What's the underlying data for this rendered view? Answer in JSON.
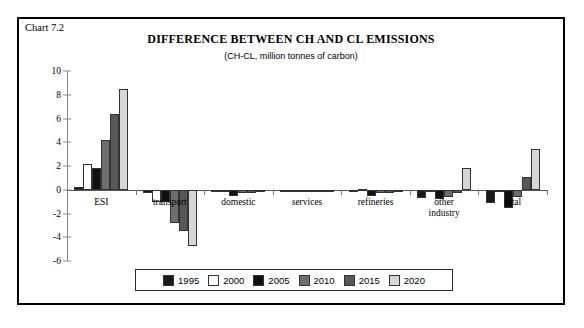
{
  "chart_label": "Chart 7.2",
  "chart_data": {
    "type": "bar",
    "title": "DIFFERENCE BETWEEN CH AND CL EMISSIONS",
    "subtitle": "(CH-CL, million tonnes of carbon)",
    "xlabel": "",
    "ylabel": "",
    "ylim": [
      -6,
      10
    ],
    "yticks": [
      10,
      8,
      6,
      4,
      2,
      0,
      -2,
      -4,
      -6
    ],
    "grid": false,
    "legend_position": "bottom",
    "categories": [
      "ESI",
      "transport",
      "domestic",
      "services",
      "refineries",
      "other industry",
      "total"
    ],
    "category_lines": [
      [
        "ESI"
      ],
      [
        "transport"
      ],
      [
        "domestic"
      ],
      [
        "services"
      ],
      [
        "refineries"
      ],
      [
        "other",
        "industry"
      ],
      [
        "total"
      ]
    ],
    "series": [
      {
        "name": "1995",
        "color": "#1a1a1a",
        "values": [
          0.2,
          -0.3,
          -0.2,
          -0.05,
          -0.1,
          -0.7,
          -1.1
        ]
      },
      {
        "name": "2000",
        "color": "#ffffff",
        "values": [
          2.2,
          -1.0,
          -0.1,
          -0.05,
          0.1,
          -0.1,
          -0.1
        ]
      },
      {
        "name": "2005",
        "color": "#111111",
        "values": [
          1.8,
          -1.0,
          -0.5,
          -0.05,
          -0.5,
          -0.8,
          -1.5
        ]
      },
      {
        "name": "2010",
        "color": "#6e6e6e",
        "values": [
          4.2,
          -2.8,
          -0.3,
          -0.05,
          -0.3,
          -0.6,
          -0.6
        ]
      },
      {
        "name": "2015",
        "color": "#585858",
        "values": [
          6.4,
          -3.5,
          -0.3,
          -0.05,
          -0.3,
          -0.3,
          1.1
        ]
      },
      {
        "name": "2020",
        "color": "#d6d6d6",
        "values": [
          8.5,
          -4.7,
          -0.2,
          -0.05,
          -0.1,
          1.8,
          3.4
        ]
      }
    ]
  },
  "legend": {
    "items": [
      {
        "label": "1995"
      },
      {
        "label": "2000"
      },
      {
        "label": "2005"
      },
      {
        "label": "2010"
      },
      {
        "label": "2015"
      },
      {
        "label": "2020"
      }
    ]
  }
}
